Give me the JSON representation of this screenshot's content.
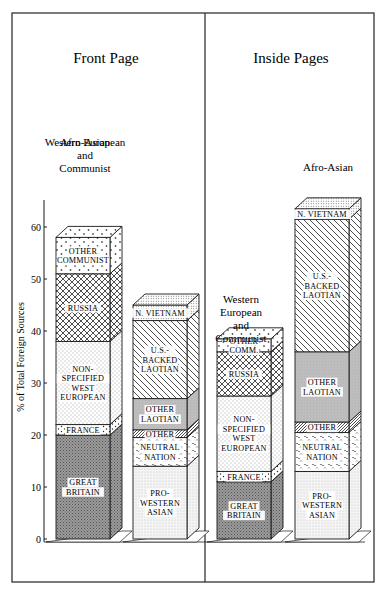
{
  "chart_data": {
    "type": "bar",
    "subtype": "stacked-3d",
    "ylabel": "% of Total Foreign Sources",
    "ylim": [
      0,
      65
    ],
    "yticks": [
      0,
      10,
      20,
      30,
      40,
      50,
      60
    ],
    "grid": false,
    "panels": [
      {
        "title": "Front Page",
        "groups": [
          {
            "label": [
              "Western European",
              "and",
              "Communist"
            ],
            "segments": [
              {
                "name": "GREAT BRITAIN",
                "lines": [
                  "GREAT",
                  "BRITAIN"
                ],
                "from": 0,
                "to": 20,
                "pattern": "dark"
              },
              {
                "name": "FRANCE",
                "lines": [
                  "FRANCE"
                ],
                "from": 20,
                "to": 22,
                "pattern": "dots"
              },
              {
                "name": "NON-SPECIFIED WEST EUROPEAN",
                "lines": [
                  "NON-",
                  "SPECIFIED",
                  "WEST",
                  "EUROPEAN"
                ],
                "from": 22,
                "to": 38,
                "pattern": "fine"
              },
              {
                "name": "RUSSIA",
                "lines": [
                  "RUSSIA"
                ],
                "from": 38,
                "to": 51,
                "pattern": "cross"
              },
              {
                "name": "OTHER COMMUNIST",
                "lines": [
                  "OTHER",
                  "COMMUNIST"
                ],
                "from": 51,
                "to": 58,
                "pattern": "plus"
              }
            ]
          },
          {
            "label": [
              "Afro-Asian"
            ],
            "segments": [
              {
                "name": "PRO-WESTERN ASIAN",
                "lines": [
                  "PRO-",
                  "WESTERN",
                  "ASIAN"
                ],
                "from": 0,
                "to": 14,
                "pattern": "light"
              },
              {
                "name": "NEUTRAL NATION",
                "lines": [
                  "NEUTRAL",
                  "NATION"
                ],
                "from": 14,
                "to": 19.5,
                "pattern": "wave"
              },
              {
                "name": "OTHER",
                "lines": [
                  "OTHER"
                ],
                "from": 19.5,
                "to": 21,
                "pattern": "hatchdense"
              },
              {
                "name": "OTHER LAOTIAN",
                "lines": [
                  "OTHER",
                  "LAOTIAN"
                ],
                "from": 21,
                "to": 27,
                "pattern": "gray"
              },
              {
                "name": "U.S.-BACKED LAOTIAN",
                "lines": [
                  "U.S.-",
                  "BACKED",
                  "LAOTIAN"
                ],
                "from": 27,
                "to": 42,
                "pattern": "diag"
              },
              {
                "name": "N. VIETNAM",
                "lines": [
                  "N. VIETNAM"
                ],
                "from": 42,
                "to": 45,
                "pattern": "grid"
              }
            ]
          }
        ]
      },
      {
        "title": "Inside Pages",
        "groups": [
          {
            "label": [
              "Western",
              "European",
              "and",
              "Communist"
            ],
            "segments": [
              {
                "name": "GREAT BRITAIN",
                "lines": [
                  "GREAT",
                  "BRITAIN"
                ],
                "from": 0,
                "to": 11,
                "pattern": "dark"
              },
              {
                "name": "FRANCE",
                "lines": [
                  "FRANCE"
                ],
                "from": 11,
                "to": 13,
                "pattern": "dots"
              },
              {
                "name": "NON-SPECIFIED WEST EUROPEAN",
                "lines": [
                  "NON-",
                  "SPECIFIED",
                  "WEST",
                  "EUROPEAN"
                ],
                "from": 13,
                "to": 27.5,
                "pattern": "fine"
              },
              {
                "name": "RUSSIA",
                "lines": [
                  "RUSSIA"
                ],
                "from": 27.5,
                "to": 36,
                "pattern": "cross"
              },
              {
                "name": "OTHER COMM.",
                "lines": [
                  "OTHER",
                  "COMM."
                ],
                "from": 36,
                "to": 38.5,
                "pattern": "plus"
              }
            ]
          },
          {
            "label": [
              "Afro-Asian"
            ],
            "segments": [
              {
                "name": "PRO-WESTERN ASIAN",
                "lines": [
                  "PRO-",
                  "WESTERN",
                  "ASIAN"
                ],
                "from": 0,
                "to": 13,
                "pattern": "light"
              },
              {
                "name": "NEUTRAL NATION",
                "lines": [
                  "NEUTRAL",
                  "NATION"
                ],
                "from": 13,
                "to": 20.5,
                "pattern": "wave"
              },
              {
                "name": "OTHER",
                "lines": [
                  "OTHER"
                ],
                "from": 20.5,
                "to": 22.5,
                "pattern": "hatchdense"
              },
              {
                "name": "OTHER LAOTIAN",
                "lines": [
                  "OTHER",
                  "LAOTIAN"
                ],
                "from": 22.5,
                "to": 36,
                "pattern": "gray"
              },
              {
                "name": "U.S.-BACKED LAOTIAN",
                "lines": [
                  "U.S.-",
                  "BACKED",
                  "LAOTIAN"
                ],
                "from": 36,
                "to": 61.5,
                "pattern": "diag"
              },
              {
                "name": "N. VIETNAM",
                "lines": [
                  "N. VIETNAM"
                ],
                "from": 61.5,
                "to": 63.5,
                "pattern": "grid"
              }
            ]
          }
        ]
      }
    ]
  },
  "layout": {
    "frame": {
      "x": 12,
      "y": 13,
      "w": 362,
      "h": 569
    },
    "divider_x": 205,
    "axis_x": 44,
    "axis_top": 200,
    "baseline_y": 539,
    "px_per_unit": 5.2,
    "depth_dx": 12,
    "depth_dy": 11,
    "bar_width": 54,
    "bar_x": [
      [
        56,
        133
      ],
      [
        217,
        295
      ]
    ],
    "panel_title_xy": [
      [
        106,
        63
      ],
      [
        291,
        63
      ]
    ],
    "group_label_top": [
      [
        [
          85,
          146
        ]
      ],
      [
        [
          241,
          303
        ],
        [
          328,
          171
        ]
      ]
    ],
    "colors": {
      "ink": "#1a1a1a",
      "gray": "#bdbdbd",
      "dark": "#8f8f8f",
      "light": "#f2f2f2",
      "frame": "#333333"
    }
  }
}
